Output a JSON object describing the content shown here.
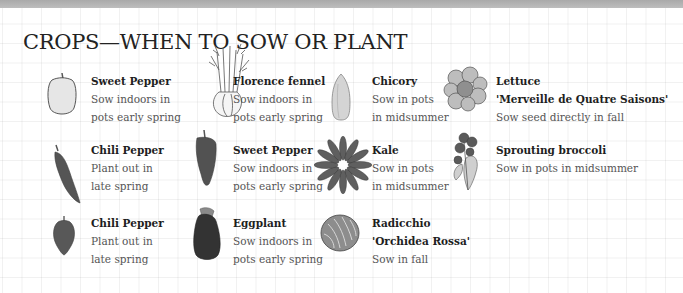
{
  "page": {
    "title": "CROPS—WHEN TO SOW OR PLANT",
    "colors": {
      "band": "#b3b3b3",
      "grid": "#ededed",
      "text_bold": "#1e1e1e",
      "text_regular": "#555555",
      "illus_dark": "#4a4a4a",
      "illus_light": "#dcdcdc"
    }
  },
  "crops": [
    {
      "name": "Sweet Pepper",
      "lines": [
        "Sow indoors in",
        "pots early spring"
      ],
      "icon": "sweet-pepper-pale-icon"
    },
    {
      "name": "Florence fennel",
      "lines": [
        "Sow indoors in",
        "pots early spring"
      ],
      "icon": "fennel-icon"
    },
    {
      "name": "Chicory",
      "lines": [
        "Sow in pots",
        "in midsummer"
      ],
      "icon": "chicory-icon"
    },
    {
      "name": "Lettuce",
      "lines": [
        "'Merveille de Quatre Saisons'",
        "Sow seed directly in fall"
      ],
      "icon": "lettuce-icon"
    },
    {
      "name": "Chili Pepper",
      "lines": [
        "Plant out in",
        "late spring"
      ],
      "icon": "chili-pepper-long-icon"
    },
    {
      "name": "Sweet Pepper",
      "lines": [
        "Sow indoors in",
        "pots early spring"
      ],
      "icon": "sweet-pepper-dark-icon"
    },
    {
      "name": "Kale",
      "lines": [
        "Sow in pots",
        "in midsummer"
      ],
      "icon": "kale-icon"
    },
    {
      "name": "Sprouting broccoli",
      "lines": [
        "Sow in pots in midsummer"
      ],
      "icon": "broccoli-icon"
    },
    {
      "name": "Chili Pepper",
      "lines": [
        "Plant out in",
        "late spring"
      ],
      "icon": "chili-pepper-round-icon"
    },
    {
      "name": "Eggplant",
      "lines": [
        "Sow indoors in",
        "pots early spring"
      ],
      "icon": "eggplant-icon"
    },
    {
      "name": "Radicchio",
      "lines": [
        "'Orchidea Rossa'",
        "Sow in fall"
      ],
      "icon": "radicchio-icon"
    }
  ]
}
